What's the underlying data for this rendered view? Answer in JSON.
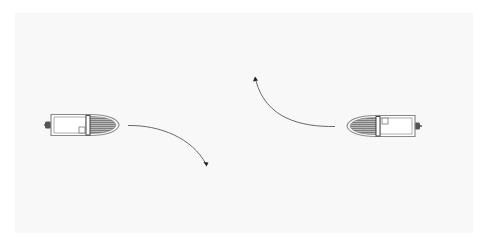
{
  "diagram": {
    "colors": {
      "background": "#ffffff",
      "panel": "#f8f8f8",
      "hull_outline": "#8a8a8a",
      "bow_hatch": "#707070",
      "path": "#6a6a6a",
      "arrowhead": "#222222"
    },
    "boats": [
      {
        "id": "left-boat",
        "heading": "east",
        "x": 49,
        "y": 114,
        "length": 70,
        "beam": 22
      },
      {
        "id": "right-boat",
        "heading": "west",
        "x": 345,
        "y": 115,
        "length": 70,
        "beam": 22
      }
    ],
    "paths": [
      {
        "id": "left-boat-path",
        "from": [
          128,
          125
        ],
        "to": [
          206,
          165
        ],
        "turn": "starboard"
      },
      {
        "id": "right-boat-path",
        "from": [
          335,
          127
        ],
        "to": [
          255,
          78
        ],
        "turn": "starboard"
      }
    ]
  }
}
